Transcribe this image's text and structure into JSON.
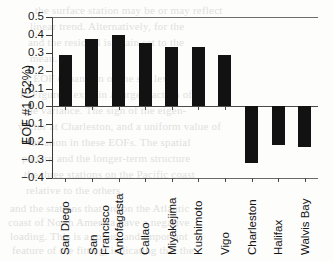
{
  "chart_data": {
    "type": "bar",
    "title": "",
    "xlabel": "",
    "ylabel": "EOF #1 (52%)",
    "ylim": [
      -0.4,
      0.5
    ],
    "ytick_labels": [
      "0.5",
      "0.4",
      "0.3",
      "0.2",
      "0.1",
      "0.0",
      "−0.1",
      "−0.2",
      "−0.3",
      "−0.4"
    ],
    "ytick_values": [
      0.5,
      0.4,
      0.3,
      0.2,
      0.1,
      0.0,
      -0.1,
      -0.2,
      -0.3,
      -0.4
    ],
    "grid": false,
    "legend": "none",
    "bar_color": "#121212",
    "categories": [
      "San Diego",
      "San Francisco",
      "Antofagasta",
      "Callao",
      "Miyakejima",
      "Kushimoto",
      "Vigo",
      "Charleston",
      "Halifax",
      "Walvis Bay"
    ],
    "category_lines": [
      [
        "San Diego"
      ],
      [
        "San",
        "Francisco"
      ],
      [
        "Antofagasta"
      ],
      [
        "Callao"
      ],
      [
        "Miyakejima"
      ],
      [
        "Kushimoto"
      ],
      [
        "Vigo"
      ],
      [
        "Charleston"
      ],
      [
        "Halifax"
      ],
      [
        "Walvis Bay"
      ]
    ],
    "values": [
      0.285,
      0.375,
      0.4,
      0.355,
      0.335,
      0.33,
      0.29,
      -0.315,
      -0.218,
      -0.228
    ]
  },
  "background_text": [
    "the surface station may be or may reflect",
    "linear trend. Alternatively, for the",
    "and the residual is again set to the",
    "mean.",
    "at EOF expansion of the sea level",
    "in Figure 1 explain a large fraction of",
    "the variance. The sign of the eigen-",
    "vector at Charleston, and a uniform value of",
    "variation in these EOFs. The spatial",
    "pattern and the longer-term structure",
    "the three stations on the Pacific coast",
    "relative to the others.",
    "and the stations that are on the Atlantic",
    "coast of North America have a negative",
    "loading. This is a robust and important",
    "feature of the fitting, indicating that the"
  ]
}
